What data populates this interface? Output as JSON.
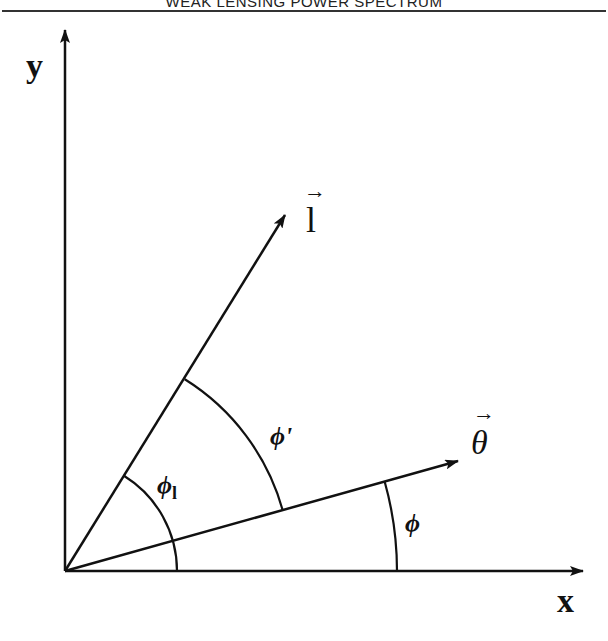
{
  "header": {
    "running_title": "WEAK LENSING POWER SPECTRUM"
  },
  "figure": {
    "axes": {
      "x_label": "x",
      "y_label": "y"
    },
    "vectors": [
      {
        "name": "l",
        "label": "l",
        "angle_deg": 58
      },
      {
        "name": "theta",
        "label": "θ",
        "angle_deg": 15.6
      }
    ],
    "angles": [
      {
        "name": "phi",
        "label": "ϕ",
        "description": "angle between x-axis and θ"
      },
      {
        "name": "phi-prime",
        "label": "ϕ'",
        "description": "angle between θ and l"
      },
      {
        "name": "phi-l",
        "label": "ϕ",
        "subscript": "l",
        "description": "angle between x-axis and l"
      }
    ],
    "arrow_glyph": "→"
  }
}
